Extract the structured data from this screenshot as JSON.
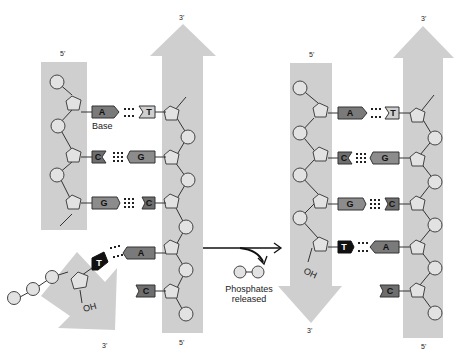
{
  "diagram": {
    "colors": {
      "strand_band": "#cfcfcf",
      "phosphate_fill": "#e2e2e2",
      "base_A": "#7a7a7a",
      "base_G": "#8c8c8c",
      "base_C": "#6e6e6e",
      "base_T_light": "#cfcfcf",
      "base_T_new": "#111111",
      "line": "#333333"
    },
    "before": {
      "left_strand": {
        "end_top": "5'",
        "end_bottom": ""
      },
      "right_strand": {
        "end_top": "3'",
        "end_bottom": "5'"
      },
      "incoming_strand": {
        "end_bottom": "3'",
        "hydroxyl": "OH"
      },
      "base_label": "Base",
      "pairs": [
        {
          "left": "A",
          "right": "T",
          "bonds": 2
        },
        {
          "left": "C",
          "right": "G",
          "bonds": 3
        },
        {
          "left": "G",
          "right": "C",
          "bonds": 3
        },
        {
          "left": "T",
          "right": "A",
          "bonds": 2,
          "incoming": true
        }
      ],
      "unpaired_right": "C"
    },
    "process": {
      "released_label_line1": "Phosphates",
      "released_label_line2": "released"
    },
    "after": {
      "left_strand": {
        "end_top": "5'",
        "end_bottom": "3'",
        "hydroxyl": "OH"
      },
      "right_strand": {
        "end_top": "3'",
        "end_bottom": "5'"
      },
      "pairs": [
        {
          "left": "A",
          "right": "T",
          "bonds": 2
        },
        {
          "left": "C",
          "right": "G",
          "bonds": 3
        },
        {
          "left": "G",
          "right": "C",
          "bonds": 3
        },
        {
          "left": "T",
          "right": "A",
          "bonds": 2
        }
      ],
      "unpaired_right": "C"
    }
  }
}
